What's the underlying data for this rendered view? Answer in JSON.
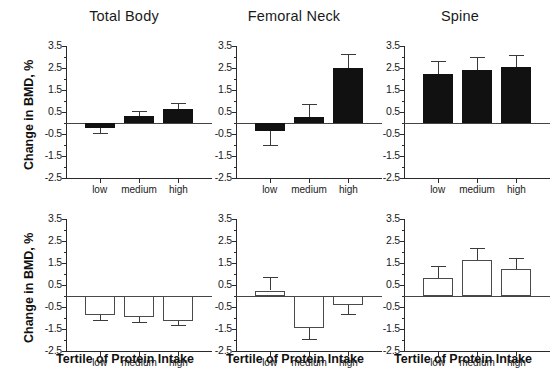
{
  "figure": {
    "y_axis_label": "Change in BMD, %",
    "x_axis_label": "Tertile of Protein Intake",
    "categories": [
      "low",
      "medium",
      "high"
    ],
    "y_ticks": [
      "3.5",
      "2.5",
      "1.5",
      "0.5",
      "-0.5",
      "-1.5",
      "-2.5"
    ],
    "colors": {
      "filled_bar": "#111111",
      "open_bar": "#ffffff",
      "axis": "#2a2a2a",
      "text": "#1a1a1a"
    },
    "titles": [
      "Total Body",
      "Femoral Neck",
      "Spine"
    ]
  },
  "chart_data": [
    {
      "type": "bar",
      "title": "Total Body",
      "row": "top",
      "bar_style": "filled",
      "categories": [
        "low",
        "medium",
        "high"
      ],
      "values": [
        -0.22,
        0.3,
        0.65
      ],
      "errors": [
        0.22,
        0.23,
        0.27
      ],
      "xlabel": "Tertile of Protein Intake",
      "ylabel": "Change in BMD, %",
      "ylim": [
        -2.5,
        3.5
      ],
      "yticks": [
        3.5,
        2.5,
        1.5,
        0.5,
        -0.5,
        -1.5,
        -2.5
      ],
      "grid": false,
      "legend": "none"
    },
    {
      "type": "bar",
      "title": "Femoral Neck",
      "row": "top",
      "bar_style": "filled",
      "categories": [
        "low",
        "medium",
        "high"
      ],
      "values": [
        -0.38,
        0.28,
        2.52
      ],
      "errors": [
        0.62,
        0.57,
        0.6
      ],
      "xlabel": "Tertile of Protein Intake",
      "ylabel": "Change in BMD, %",
      "ylim": [
        -2.5,
        3.5
      ],
      "yticks": [
        3.5,
        2.5,
        1.5,
        0.5,
        -0.5,
        -1.5,
        -2.5
      ],
      "grid": false,
      "legend": "none"
    },
    {
      "type": "bar",
      "title": "Spine",
      "row": "top",
      "bar_style": "filled",
      "categories": [
        "low",
        "medium",
        "high"
      ],
      "values": [
        2.22,
        2.42,
        2.55
      ],
      "errors": [
        0.6,
        0.57,
        0.55
      ],
      "xlabel": "Tertile of Protein Intake",
      "ylabel": "Change in BMD, %",
      "ylim": [
        -2.5,
        3.5
      ],
      "yticks": [
        3.5,
        2.5,
        1.5,
        0.5,
        -0.5,
        -1.5,
        -2.5
      ],
      "grid": false,
      "legend": "none"
    },
    {
      "type": "bar",
      "title": "Total Body",
      "row": "bottom",
      "bar_style": "open",
      "categories": [
        "low",
        "medium",
        "high"
      ],
      "values": [
        -0.85,
        -0.95,
        -1.12
      ],
      "errors": [
        0.22,
        0.25,
        0.2
      ],
      "xlabel": "Tertile of Protein Intake",
      "ylabel": "Change in BMD, %",
      "ylim": [
        -2.5,
        3.5
      ],
      "yticks": [
        3.5,
        2.5,
        1.5,
        0.5,
        -0.5,
        -1.5,
        -2.5
      ],
      "grid": false,
      "legend": "none"
    },
    {
      "type": "bar",
      "title": "Femoral Neck",
      "row": "bottom",
      "bar_style": "open",
      "categories": [
        "low",
        "medium",
        "high"
      ],
      "values": [
        0.25,
        -1.45,
        -0.4
      ],
      "errors": [
        0.62,
        0.52,
        0.43
      ],
      "xlabel": "Tertile of Protein Intake",
      "ylabel": "Change in BMD, %",
      "ylim": [
        -2.5,
        3.5
      ],
      "yticks": [
        3.5,
        2.5,
        1.5,
        0.5,
        -0.5,
        -1.5,
        -2.5
      ],
      "grid": false,
      "legend": "none"
    },
    {
      "type": "bar",
      "title": "Spine",
      "row": "bottom",
      "bar_style": "open",
      "categories": [
        "low",
        "medium",
        "high"
      ],
      "values": [
        0.82,
        1.62,
        1.22
      ],
      "errors": [
        0.55,
        0.55,
        0.52
      ],
      "xlabel": "Tertile of Protein Intake",
      "ylabel": "Change in BMD, %",
      "ylim": [
        -2.5,
        3.5
      ],
      "yticks": [
        3.5,
        2.5,
        1.5,
        0.5,
        -0.5,
        -1.5,
        -2.5
      ],
      "grid": false,
      "legend": "none"
    }
  ]
}
